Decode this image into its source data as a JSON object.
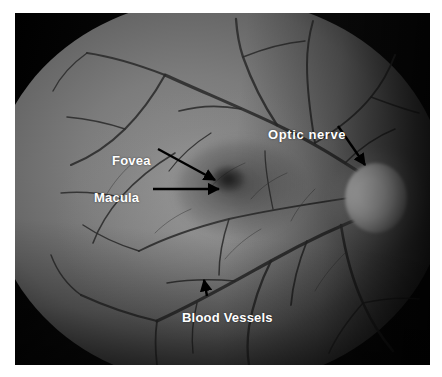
{
  "figure": {
    "type": "annotated-photograph",
    "background_color": "#ffffff",
    "label_color": "#ffffff",
    "arrow_color": "#000000"
  },
  "photo": {
    "frame_color": "#0a0a0a",
    "retina_color": "#7c7c7c",
    "optic_disc_color": "#ffffff",
    "macula_color": "#2a2a2a"
  },
  "annotations": [
    {
      "id": "optic-nerve",
      "label": "Optic  nerve",
      "target": "optic disc",
      "arrow": "down-right"
    },
    {
      "id": "fovea",
      "label": "Fovea",
      "target": "foveal center",
      "arrow": "down-right"
    },
    {
      "id": "macula",
      "label": "Macula",
      "target": "macular region",
      "arrow": "right"
    },
    {
      "id": "blood-vessels",
      "label": "Blood Vessels",
      "target": "retinal vessel",
      "arrow": "up"
    }
  ]
}
